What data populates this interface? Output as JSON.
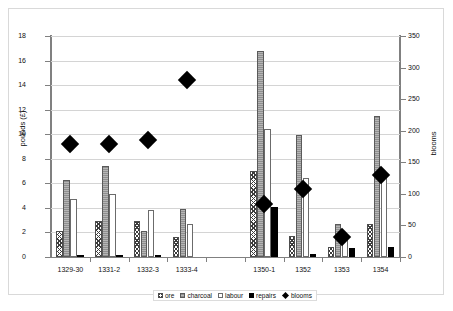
{
  "chart_data": {
    "type": "bar",
    "title": "",
    "xlabel": "",
    "ylabel": "pounds (£)",
    "y2label": "blooms",
    "ylim": [
      0,
      18
    ],
    "y2lim": [
      0,
      350
    ],
    "grid": true,
    "legend_position": "bottom",
    "categories": [
      "1329-30",
      "1331-2",
      "1332-3",
      "1333-4",
      "",
      "1350-1",
      "1352",
      "1353",
      "1354"
    ],
    "y_ticks": [
      "0",
      "2",
      "4",
      "6",
      "8",
      "10",
      "12",
      "14",
      "16",
      "18"
    ],
    "y2_ticks": [
      "0",
      "50",
      "100",
      "150",
      "200",
      "250",
      "300",
      "350"
    ],
    "series": [
      {
        "name": "ore",
        "axis": "left",
        "values": [
          2.15,
          2.9,
          2.95,
          1.6,
          null,
          7.0,
          1.75,
          0.8,
          2.65
        ]
      },
      {
        "name": "charcoal",
        "axis": "left",
        "values": [
          6.3,
          7.4,
          2.1,
          3.9,
          null,
          16.75,
          9.9,
          2.7,
          11.45
        ]
      },
      {
        "name": "labour",
        "axis": "left",
        "values": [
          4.7,
          5.1,
          3.8,
          2.7,
          null,
          10.4,
          6.4,
          1.55,
          6.4
        ]
      },
      {
        "name": "repairs",
        "axis": "left",
        "values": [
          0.07,
          0.06,
          0.12,
          0.0,
          null,
          4.05,
          0.28,
          0.72,
          0.85
        ]
      },
      {
        "name": "blooms",
        "axis": "right",
        "marker": "diamond",
        "values": [
          190,
          189,
          195,
          290,
          null,
          95,
          118,
          42,
          140
        ]
      }
    ]
  },
  "legend": {
    "items": [
      {
        "label": "ore",
        "swatch": "ore-hatch-swatch"
      },
      {
        "label": "charcoal",
        "swatch": "charcoal-hatch-swatch"
      },
      {
        "label": "labour",
        "swatch": "labour-white-swatch"
      },
      {
        "label": "repairs",
        "swatch": "repairs-black-swatch"
      },
      {
        "label": "blooms",
        "swatch": "blooms-diamond-swatch"
      }
    ]
  }
}
